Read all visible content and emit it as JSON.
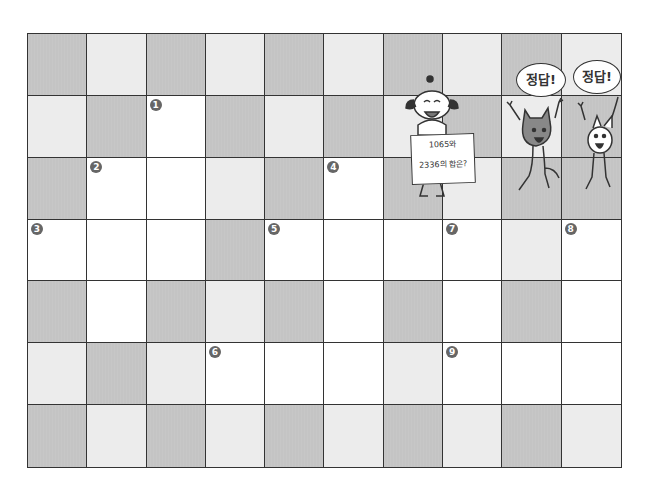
{
  "board": {
    "rows": 7,
    "cols": 10,
    "colors": {
      "dark": "#c4c4c4",
      "light": "#ececec",
      "white": "#ffffff"
    },
    "cells": [
      [
        "dark",
        "light",
        "dark",
        "light",
        "dark",
        "light",
        "dark",
        "light",
        "dark",
        "light"
      ],
      [
        "light",
        "dark",
        "white",
        "dark",
        "light",
        "dark",
        "light",
        "dark",
        "light",
        "dark"
      ],
      [
        "dark",
        "white",
        "white",
        "light",
        "dark",
        "white",
        "dark",
        "light",
        "dark",
        "dark"
      ],
      [
        "white",
        "white",
        "white",
        "dark",
        "white",
        "white",
        "white",
        "white",
        "light",
        "white"
      ],
      [
        "dark",
        "white",
        "dark",
        "light",
        "dark",
        "white",
        "dark",
        "white",
        "dark",
        "white"
      ],
      [
        "light",
        "dark",
        "light",
        "white",
        "white",
        "white",
        "light",
        "white",
        "white",
        "white"
      ],
      [
        "dark",
        "light",
        "dark",
        "light",
        "dark",
        "light",
        "dark",
        "light",
        "dark",
        "light"
      ]
    ],
    "numbers": [
      {
        "row": 1,
        "col": 2,
        "label": "1"
      },
      {
        "row": 2,
        "col": 1,
        "label": "2"
      },
      {
        "row": 3,
        "col": 0,
        "label": "3"
      },
      {
        "row": 2,
        "col": 5,
        "label": "4"
      },
      {
        "row": 3,
        "col": 4,
        "label": "5"
      },
      {
        "row": 5,
        "col": 3,
        "label": "6"
      },
      {
        "row": 3,
        "col": 7,
        "label": "7"
      },
      {
        "row": 3,
        "col": 9,
        "label": "8"
      },
      {
        "row": 5,
        "col": 7,
        "label": "9"
      }
    ]
  },
  "characters": {
    "dog": {
      "sign_line1": "1065와",
      "sign_line2": "2336의 합은?"
    },
    "cat": {
      "speech": "정답!"
    },
    "rabbit": {
      "speech": "정답!"
    }
  }
}
